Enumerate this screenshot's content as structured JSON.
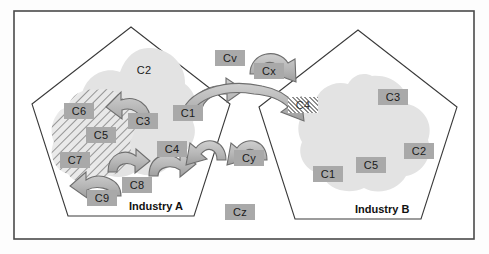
{
  "diagram": {
    "colors": {
      "frame_border": "#4a4a4a",
      "pentagon_border": "#3a3a3a",
      "blob_fill": "#e3e3e3",
      "blob_dark_fill": "#d2d2d2",
      "label_box": "#a9a9a9",
      "arrow_fill": "#b9b9b9",
      "arrow_stroke": "#6e6e6e",
      "hatch_line": "#8f8f8f",
      "text": "#1a1a1a",
      "background": "#fdfdfd"
    }
  },
  "regions": {
    "industry_a": {
      "label": "Industry A"
    },
    "industry_b": {
      "label": "Industry B"
    }
  },
  "labels": {
    "industry_a_blob": [
      {
        "id": "a-c2",
        "text": "C2",
        "x": 129,
        "y": 62,
        "style": "plain"
      },
      {
        "id": "a-c3",
        "text": "C3",
        "x": 128,
        "y": 113,
        "style": "box"
      },
      {
        "id": "a-c1",
        "text": "C1",
        "x": 173,
        "y": 105,
        "style": "box"
      },
      {
        "id": "a-c4",
        "text": "C4",
        "x": 157,
        "y": 141,
        "style": "box"
      }
    ],
    "industry_a_hatched": [
      {
        "id": "a-c6",
        "text": "C6",
        "x": 64,
        "y": 103,
        "style": "box"
      },
      {
        "id": "a-c5",
        "text": "C5",
        "x": 86,
        "y": 127,
        "style": "box"
      },
      {
        "id": "a-c7",
        "text": "C7",
        "x": 60,
        "y": 152,
        "style": "box"
      },
      {
        "id": "a-c8",
        "text": "C8",
        "x": 122,
        "y": 177,
        "style": "box"
      },
      {
        "id": "a-c9",
        "text": "C9",
        "x": 87,
        "y": 190,
        "style": "box"
      }
    ],
    "industry_b_blob": [
      {
        "id": "b-c3",
        "text": "C3",
        "x": 378,
        "y": 89,
        "style": "box"
      },
      {
        "id": "b-c2",
        "text": "C2",
        "x": 404,
        "y": 143,
        "style": "box"
      },
      {
        "id": "b-c5",
        "text": "C5",
        "x": 356,
        "y": 157,
        "style": "box"
      },
      {
        "id": "b-c1",
        "text": "C1",
        "x": 313,
        "y": 166,
        "style": "box"
      }
    ],
    "intermediaries": [
      {
        "id": "cv",
        "text": "Cv",
        "x": 215,
        "y": 50,
        "style": "box"
      },
      {
        "id": "cx",
        "text": "Cx",
        "x": 254,
        "y": 63,
        "style": "box"
      },
      {
        "id": "c4-hatched",
        "text": "C4",
        "x": 288,
        "y": 97,
        "style": "hatch"
      },
      {
        "id": "cy",
        "text": "Cy",
        "x": 234,
        "y": 150,
        "style": "box"
      },
      {
        "id": "cz",
        "text": "Cz",
        "x": 225,
        "y": 204,
        "style": "box"
      }
    ]
  },
  "arrows": [
    {
      "id": "arrow-c3-to-c6",
      "from": "C3",
      "to": "C6"
    },
    {
      "id": "arrow-c1-to-cx",
      "from": "C1",
      "to": "Cx"
    },
    {
      "id": "arrow-c5-to-c8",
      "from": "C5",
      "to": "C8"
    },
    {
      "id": "arrow-c8-to-c4",
      "from": "C8",
      "to": "C4"
    },
    {
      "id": "arrow-c9-to-c7",
      "from": "C9",
      "to": "C7"
    },
    {
      "id": "arrow-cx-arc",
      "from": "Cx",
      "to": "C4-hatched"
    },
    {
      "id": "arrow-main-span",
      "from": "C1",
      "to": "C4-hatched"
    },
    {
      "id": "arrow-cy-left",
      "from": "Cy",
      "to": "Industry A"
    },
    {
      "id": "arrow-cy-right",
      "from": "Cy",
      "to": "Industry B"
    }
  ]
}
